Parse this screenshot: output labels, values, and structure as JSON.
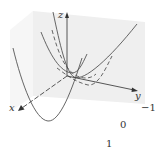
{
  "diagram": {
    "type": "3d-surface-traces",
    "axes": {
      "x_label": "x",
      "y_label": "y",
      "z_label": "z"
    },
    "plane_labels": [
      "−1",
      "0",
      "1"
    ],
    "curves": [
      {
        "name": "trace-front",
        "style": "solid"
      },
      {
        "name": "trace-middle",
        "style": "solid"
      },
      {
        "name": "trace-back",
        "style": "solid"
      },
      {
        "name": "trace-dashed-1",
        "style": "dashed"
      },
      {
        "name": "trace-dashed-2",
        "style": "dashed"
      }
    ],
    "colors": {
      "curve": "#555555",
      "axis": "#444444",
      "plane": "#ececec"
    }
  }
}
